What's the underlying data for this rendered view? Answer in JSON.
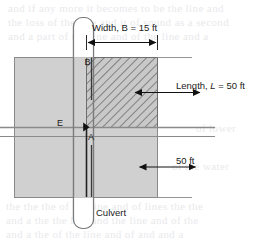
{
  "figure": {
    "labels": {
      "width_dim": "Width, B = 15 ft",
      "length_dim_prefix": "Length, ",
      "length_dim_italic": "L",
      "length_dim_suffix": " = 50 ft",
      "lower_dim": "50 ft",
      "point_b": "B",
      "point_e": "E",
      "point_a": "A",
      "culvert": "Culvert"
    },
    "values": {
      "width_b_ft": 15,
      "length_l_ft": 50,
      "lower_length_ft": 50
    },
    "colors": {
      "ground_fill": "#d0d0d0",
      "hatch_fill": "#c8c8c8",
      "hatch_line": "#6e6e6e",
      "outline": "#8a8a8a",
      "dim_line": "#111111",
      "culvert_line": "#7a7a7a",
      "culvert_fill": "#ffffff",
      "text": "#1a1a1a",
      "background": "#ffffff"
    },
    "icons": {
      "arrow_left": "arrow-left-icon",
      "arrow_right": "arrow-right-icon",
      "arrow_up": "arrow-up-icon",
      "arrow_down": "arrow-down-icon"
    }
  },
  "page_bleed": {
    "lines": [
      "and if any more it becomes to be the line and",
      "the loss of the line and it of sound as a second",
      "and a part of the line and of the line and a"
    ],
    "mid_right": "of lower",
    "lower_left": "of the water",
    "lower_lines": [
      "the the the of the line and of lines the the",
      "and a the the line and the line and of the",
      "and a the of the line and of and and a"
    ]
  }
}
